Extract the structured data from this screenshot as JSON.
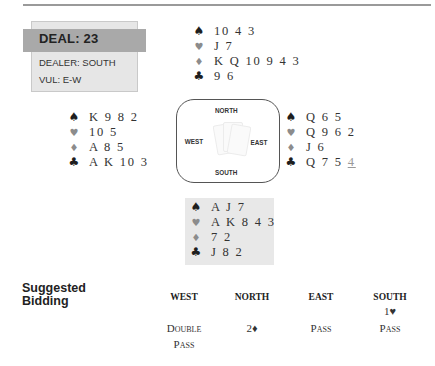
{
  "deal": {
    "title": "DEAL: 23",
    "dealer": "DEALER: SOUTH",
    "vulnerability": "VUL: E-W"
  },
  "suit_icons": {
    "spades": "♠",
    "hearts": "♥",
    "diamonds": "♦",
    "clubs": "♣"
  },
  "hands": {
    "north": {
      "spades": "10 4 3",
      "hearts": "J 7",
      "diamonds": "K Q 10 9 4 3",
      "clubs": "9 6"
    },
    "west": {
      "spades": "K 9 8 2",
      "hearts": "10 5",
      "diamonds": "A 8 5",
      "clubs": "A K 10 3"
    },
    "east": {
      "spades": "Q 6 5",
      "hearts": "Q 9 6 2",
      "diamonds": "J 6",
      "clubs_main": "Q 7 5 ",
      "clubs_highlight": "4"
    },
    "south": {
      "spades": "A J 7",
      "hearts": "A K 8 4 3",
      "diamonds": "7 2",
      "clubs": "J 8 2"
    }
  },
  "compass": {
    "north": "NORTH",
    "south": "SOUTH",
    "east": "EAST",
    "west": "WEST"
  },
  "bidding": {
    "heading_line1": "Suggested",
    "heading_line2": "Bidding",
    "columns": [
      "WEST",
      "NORTH",
      "EAST",
      "SOUTH"
    ],
    "rows": [
      [
        "",
        "",
        "",
        "1♥"
      ],
      [
        "Double",
        "2♦",
        "Pass",
        "Pass"
      ],
      [
        "Pass",
        "",
        "",
        ""
      ]
    ]
  },
  "colors": {
    "header_bar": "#a9a9a9",
    "deal_box": "#e6e6e6",
    "black_suit": "#1e1e1e",
    "red_suit_grey": "#8c8c8c",
    "south_bg": "#e8e8e8"
  }
}
